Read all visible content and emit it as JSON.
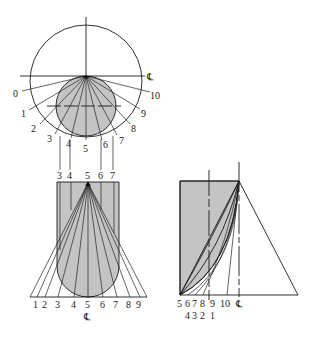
{
  "figure": {
    "colors": {
      "fill": "#c4c4c4",
      "line": "#1a1a1a",
      "background": "#ffffff"
    },
    "centerline_symbol": "℄"
  },
  "top_view": {
    "radial_labels": [
      "0",
      "1",
      "2",
      "3",
      "4",
      "5",
      "6",
      "7",
      "8",
      "9",
      "10"
    ],
    "centerline_label": "℄"
  },
  "front_view": {
    "top_labels": [
      "3",
      "4",
      "5",
      "6",
      "7"
    ],
    "bottom_labels": [
      "1",
      "2",
      "3",
      "4",
      "5",
      "6",
      "7",
      "8",
      "9"
    ],
    "centerline_label": "℄"
  },
  "true_length_diagram": {
    "bottom_labels_row1": [
      "5",
      "6",
      "7",
      "8",
      "9",
      "10",
      "℄"
    ],
    "bottom_labels_row2": [
      "4",
      "3",
      "2",
      "1"
    ]
  }
}
